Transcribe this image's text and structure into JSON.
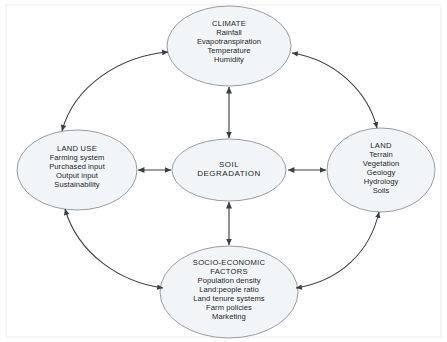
{
  "diagram": {
    "type": "conceptual-flow-diagram",
    "background_color": "#ffffff",
    "node_fill_color": "#f2f5f8",
    "node_stroke_color": "#8a919b",
    "connector_color": "#3a3f46",
    "frame_color": "#e8eaed",
    "nodes": {
      "center": {
        "id": "soil-degradation",
        "title": "SOIL",
        "title2": "DEGRADATION",
        "items": [],
        "cx": 229,
        "cy": 170,
        "rx": 57,
        "ry": 31
      },
      "top": {
        "id": "climate",
        "title": "CLIMATE",
        "items": [
          "Rainfall",
          "Evapotranspiration",
          "Temperature",
          "Humidity"
        ],
        "cx": 229,
        "cy": 46,
        "rx": 62,
        "ry": 40
      },
      "left": {
        "id": "land-use",
        "title": "LAND USE",
        "items": [
          "Farming system",
          "Purchased input",
          "Output input",
          "Sustainability"
        ],
        "cx": 77,
        "cy": 170,
        "rx": 60,
        "ry": 40
      },
      "right": {
        "id": "land",
        "title": "LAND",
        "items": [
          "Terrain",
          "Vegetation",
          "Geology",
          "Hydrology",
          "Soils"
        ],
        "cx": 381,
        "cy": 170,
        "rx": 54,
        "ry": 42
      },
      "bottom": {
        "id": "socio-economic-factors",
        "title": "SOCIO-ECONOMIC",
        "title2": "FACTORS",
        "items": [
          "Population density",
          "Land:people ratio",
          "Land tenure systems",
          "Farm policies",
          "Marketing"
        ],
        "cx": 229,
        "cy": 292,
        "rx": 69,
        "ry": 46
      }
    },
    "connectors": [
      {
        "id": "climate-to-center",
        "from": "climate",
        "to": "soil-degradation",
        "style": "straight",
        "arrows": "both"
      },
      {
        "id": "land-use-to-center",
        "from": "land-use",
        "to": "soil-degradation",
        "style": "straight",
        "arrows": "both"
      },
      {
        "id": "land-to-center",
        "from": "land",
        "to": "soil-degradation",
        "style": "straight",
        "arrows": "both"
      },
      {
        "id": "socio-economic-to-center",
        "from": "socio-economic-factors",
        "to": "soil-degradation",
        "style": "straight",
        "arrows": "both"
      },
      {
        "id": "land-use-to-climate",
        "from": "land-use",
        "to": "climate",
        "style": "curved",
        "arrows": "both"
      },
      {
        "id": "climate-to-land",
        "from": "climate",
        "to": "land",
        "style": "curved",
        "arrows": "both"
      },
      {
        "id": "land-use-to-socio-economic",
        "from": "land-use",
        "to": "socio-economic-factors",
        "style": "curved",
        "arrows": "both"
      },
      {
        "id": "socio-economic-to-land",
        "from": "socio-economic-factors",
        "to": "land",
        "style": "curved",
        "arrows": "both"
      }
    ]
  }
}
